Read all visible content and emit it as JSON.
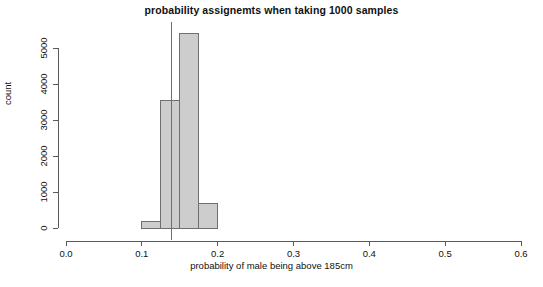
{
  "chart_data": {
    "type": "bar",
    "title": "probability assignemts when taking 1000 samples",
    "xlabel": "probability of male being above 185cm",
    "ylabel": "count",
    "xlim": [
      0.0,
      0.6
    ],
    "ylim": [
      0,
      5600
    ],
    "xticks": [
      "0.0",
      "0.1",
      "0.2",
      "0.3",
      "0.4",
      "0.5",
      "0.6"
    ],
    "xtick_values": [
      0.0,
      0.1,
      0.2,
      0.3,
      0.4,
      0.5,
      0.6
    ],
    "yticks": [
      "0",
      "1000",
      "2000",
      "3000",
      "4000",
      "5000"
    ],
    "ytick_values": [
      0,
      1000,
      2000,
      3000,
      4000,
      5000
    ],
    "grid": false,
    "legend": null,
    "bin_width": 0.025,
    "bin_edges": [
      0.1,
      0.125,
      0.15,
      0.175,
      0.2
    ],
    "categories": [
      "0.100-0.125",
      "0.125-0.150",
      "0.150-0.175",
      "0.175-0.200"
    ],
    "values": [
      190,
      3550,
      5400,
      690
    ],
    "annotations": [
      {
        "type": "vertical-line",
        "name": "true-probability-marker",
        "x": 0.139
      }
    ]
  }
}
